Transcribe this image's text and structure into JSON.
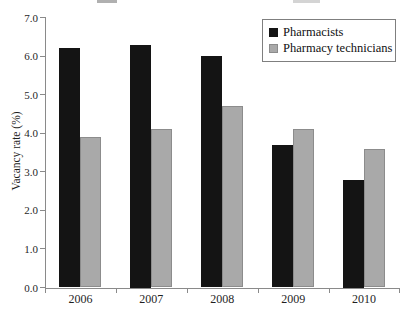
{
  "chart_data": {
    "type": "bar",
    "title": "",
    "title_note": "title cropped off at top edge of screenshot",
    "ylabel": "Vacancy rate (%)",
    "xlabel": "",
    "categories": [
      "2006",
      "2007",
      "2008",
      "2009",
      "2010"
    ],
    "series": [
      {
        "name": "Pharmacists",
        "color": "#141414",
        "border": "#141414",
        "values": [
          6.2,
          6.3,
          6.0,
          3.7,
          2.8
        ]
      },
      {
        "name": "Pharmacy technicians",
        "color": "#a9a9a9",
        "border": "#8c8c8c",
        "values": [
          3.9,
          4.1,
          4.7,
          4.1,
          3.6
        ]
      }
    ],
    "ylim": [
      0,
      7
    ],
    "ytick_labels": [
      "0.0",
      "1.0",
      "2.0",
      "3.0",
      "4.0",
      "5.0",
      "6.0",
      "7.0"
    ],
    "grid": false,
    "legend_position": "top-right",
    "axis_color": "#8a8a8a"
  }
}
